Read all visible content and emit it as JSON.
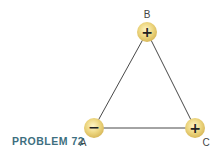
{
  "figure": {
    "caption": "PROBLEM 72",
    "caption_color": "#3e6f80",
    "line_color": "#333333",
    "charge_fill": "#e9d27a",
    "charges": [
      {
        "label": "A",
        "sign": "−",
        "x": 94,
        "y": 128,
        "label_x": 83,
        "label_y": 142
      },
      {
        "label": "B",
        "sign": "+",
        "x": 147,
        "y": 32,
        "label_x": 147,
        "label_y": 14
      },
      {
        "label": "C",
        "sign": "+",
        "x": 195,
        "y": 128,
        "label_x": 206,
        "label_y": 142
      }
    ]
  }
}
